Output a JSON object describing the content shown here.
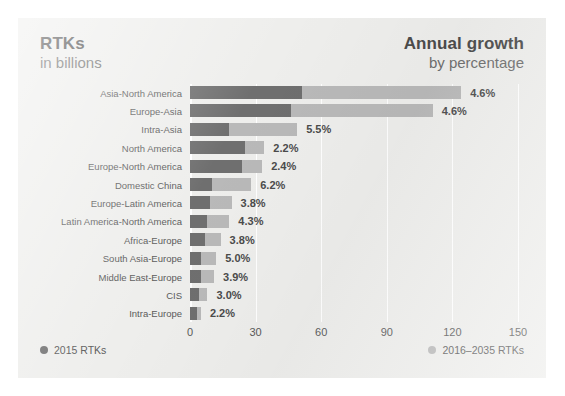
{
  "figure": {
    "header_left": {
      "line1": "RTKs",
      "line2": "in billions"
    },
    "header_right": {
      "line1": "Annual growth",
      "line2": "by percentage"
    }
  },
  "legend": {
    "position": "bottom",
    "items": [
      {
        "label": "2015 RTKs",
        "color": "#6f6f6f",
        "swatch": "dot-icon"
      },
      {
        "label": "2016–2035 RTKs",
        "color": "#b9b9b9",
        "swatch": "dot-icon"
      }
    ]
  },
  "chart_data": {
    "type": "bar",
    "orientation": "horizontal",
    "stacked": true,
    "xlabel": "",
    "ylabel": "",
    "xlim": [
      0,
      150
    ],
    "xticks": [
      0,
      30,
      60,
      90,
      120,
      150
    ],
    "ticklabels": [
      "0",
      "30",
      "60",
      "90",
      "120",
      "150"
    ],
    "grid": true,
    "grid_color": "#ffffff",
    "categories": [
      "Asia-North America",
      "Europe-Asia",
      "Intra-Asia",
      "North America",
      "Europe-North America",
      "Domestic China",
      "Europe-Latin America",
      "Latin America-North America",
      "Africa-Europe",
      "South Asia-Europe",
      "Middle East-Europe",
      "CIS",
      "Intra-Europe"
    ],
    "series": [
      {
        "name": "2015 RTKs",
        "color": "#6f6f6f",
        "values": [
          51,
          46,
          18,
          25,
          24,
          10,
          9,
          8,
          7,
          5,
          5,
          4,
          3
        ]
      },
      {
        "name": "2016–2035 RTKs",
        "color": "#b9b9b9",
        "values": [
          73,
          65,
          31,
          9,
          9,
          18,
          10,
          10,
          7,
          7,
          6,
          4,
          2
        ]
      }
    ],
    "annotations": {
      "name": "annual-growth-percent",
      "values": [
        "4.6%",
        "4.6%",
        "5.5%",
        "2.2%",
        "2.4%",
        "6.2%",
        "3.8%",
        "4.3%",
        "3.8%",
        "5.0%",
        "3.9%",
        "3.0%",
        "2.2%"
      ]
    }
  }
}
